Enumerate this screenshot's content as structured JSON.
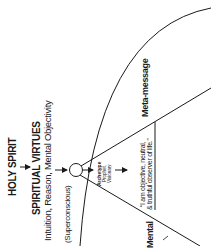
{
  "diagram": {
    "source_label": "HOLY SPIRIT",
    "virtues_title": "SPIRITUAL VIRTUES",
    "virtues_list": "Intuition, Reason, Mental Objectivity",
    "level_label": "(Superconscious)",
    "archetype": {
      "title": "Archetype",
      "line1": "Prophet,",
      "line2": "Visionary"
    },
    "quote": {
      "line1": "“I am objective, neutral,",
      "line2": "& truthful observer of life.”"
    },
    "meta_message_label": "Meta-message",
    "mental_label": "Mental"
  },
  "colors": {
    "stroke": "#1a1a1a",
    "text": "#1a1a1a",
    "background": "#ffffff"
  }
}
